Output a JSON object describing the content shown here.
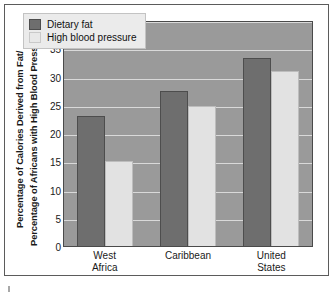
{
  "chart_data": {
    "type": "bar",
    "title": "",
    "xlabel": "",
    "ylabel": "Percentage of Calories Derived from Fat/ Percentage of Africans with High Blood Pressure",
    "ylabel_lines": [
      "Percentage of Calories Derived from Fat/",
      "Percentage of Africans with High Blood Pressure"
    ],
    "categories": [
      "West Africa",
      "Caribbean",
      "United States"
    ],
    "category_lines": [
      [
        "West",
        "Africa"
      ],
      [
        "Caribbean",
        ""
      ],
      [
        "United",
        "States"
      ]
    ],
    "series": [
      {
        "name": "Dietary fat",
        "values": [
          23,
          27.5,
          33.3
        ],
        "color": "#6e6e6e"
      },
      {
        "name": "High blood pressure",
        "values": [
          15,
          24.7,
          31
        ],
        "color": "#e2e2e2"
      }
    ],
    "ylim": [
      0,
      40
    ],
    "ytick_values": [
      0,
      5,
      10,
      15,
      20,
      25,
      30,
      35,
      40
    ],
    "ytick_labels": [
      "0",
      "5",
      "10",
      "15",
      "20",
      "25",
      "30",
      "35",
      "40"
    ],
    "grid": true,
    "legend_position": "upper left",
    "plot_background": "#9a9a9a",
    "gridline_color": "#d9d9d9",
    "frame_color": "#5b5b5b"
  },
  "legend": {
    "entries": [
      {
        "label": "Dietary fat",
        "swatch": "dark-gray-swatch"
      },
      {
        "label": "High blood pressure",
        "swatch": "light-gray-swatch"
      }
    ]
  }
}
